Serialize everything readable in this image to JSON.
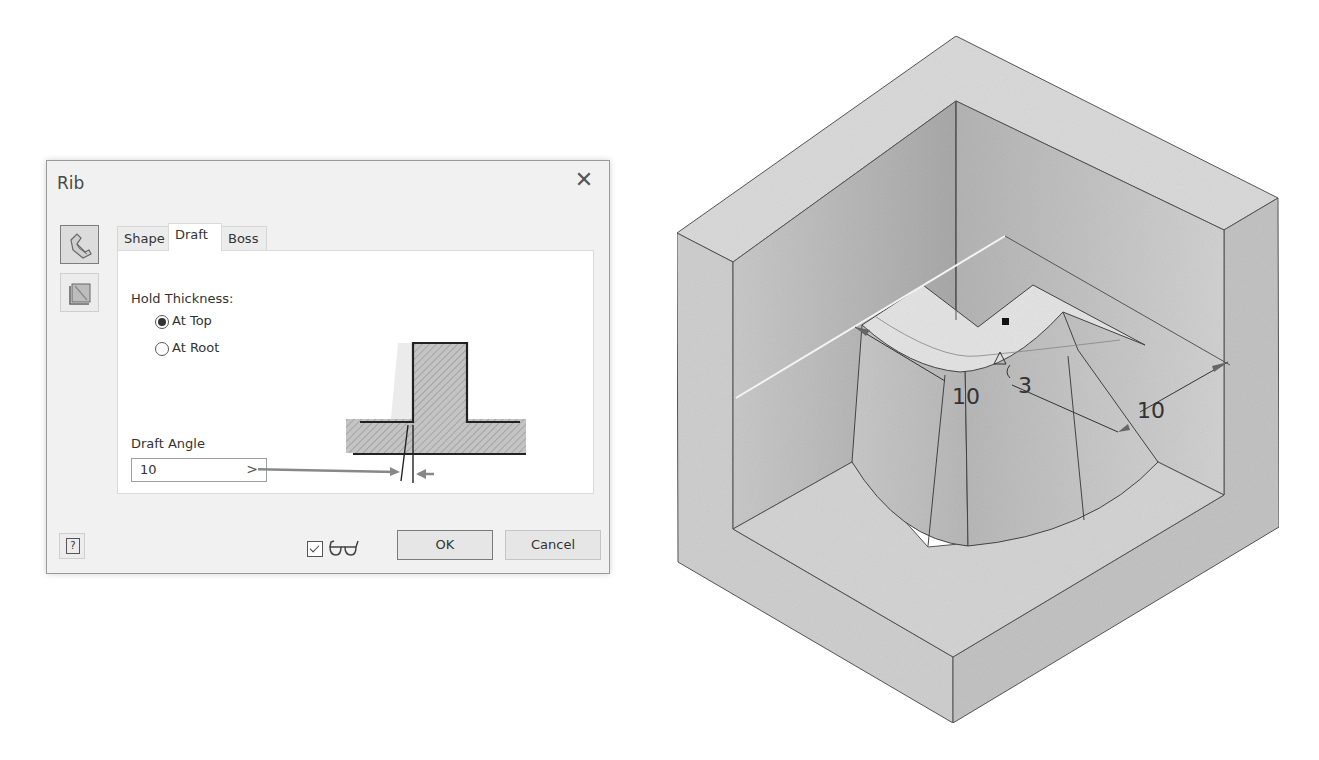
{
  "dialog": {
    "title": "Rib",
    "close_icon": "close-icon",
    "side_buttons": [
      {
        "icon": "rib-profile-icon",
        "state": "active"
      },
      {
        "icon": "rib-direction-icon",
        "state": "inactive"
      }
    ],
    "tabs": [
      {
        "label": "Shape",
        "active": false
      },
      {
        "label": "Draft",
        "active": true
      },
      {
        "label": "Boss",
        "active": false
      }
    ],
    "draft_tab": {
      "hold_thickness_label": "Hold Thickness:",
      "options": [
        {
          "label": "At Top",
          "checked": true
        },
        {
          "label": "At Root",
          "checked": false
        }
      ],
      "draft_angle_label": "Draft Angle",
      "draft_angle_value": "10",
      "draft_angle_arrow": ">"
    },
    "footer": {
      "help_label": "?",
      "preview_checked": true,
      "preview_icon": "glasses-icon",
      "ok_label": "OK",
      "cancel_label": "Cancel"
    }
  },
  "model_view": {
    "dimensions": [
      {
        "label": "10",
        "role": "left-dimension"
      },
      {
        "label": "3",
        "role": "thickness-dimension"
      },
      {
        "label": "10",
        "role": "right-dimension"
      }
    ]
  }
}
